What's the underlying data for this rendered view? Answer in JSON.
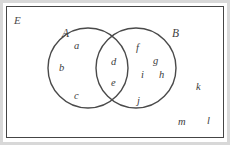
{
  "diagram": {
    "type": "venn",
    "universe_label": "E",
    "sets": [
      {
        "id": "A",
        "label": "A",
        "side": "left"
      },
      {
        "id": "B",
        "label": "B",
        "side": "right"
      }
    ],
    "regions": {
      "A_only": [
        "a",
        "b",
        "c"
      ],
      "intersection": [
        "d",
        "e"
      ],
      "B_only": [
        "f",
        "g",
        "i",
        "h",
        "j"
      ],
      "outside": [
        "k",
        "m",
        "l"
      ]
    },
    "elements": [
      {
        "text": "a",
        "region": "A_only",
        "x": 74,
        "y": 41
      },
      {
        "text": "b",
        "region": "A_only",
        "x": 59,
        "y": 63
      },
      {
        "text": "c",
        "region": "A_only",
        "x": 74,
        "y": 91
      },
      {
        "text": "d",
        "region": "intersection",
        "x": 111,
        "y": 57
      },
      {
        "text": "e",
        "region": "intersection",
        "x": 111,
        "y": 78
      },
      {
        "text": "f",
        "region": "B_only",
        "x": 136,
        "y": 43
      },
      {
        "text": "g",
        "region": "B_only",
        "x": 153,
        "y": 56
      },
      {
        "text": "i",
        "region": "B_only",
        "x": 141,
        "y": 70
      },
      {
        "text": "h",
        "region": "B_only",
        "x": 159,
        "y": 70
      },
      {
        "text": "j",
        "region": "B_only",
        "x": 137,
        "y": 96
      },
      {
        "text": "k",
        "region": "outside",
        "x": 196,
        "y": 82
      },
      {
        "text": "m",
        "region": "outside",
        "x": 178,
        "y": 117
      },
      {
        "text": "l",
        "region": "outside",
        "x": 207,
        "y": 116
      }
    ],
    "set_labels": [
      {
        "text": "A",
        "x": 62,
        "y": 28
      },
      {
        "text": "B",
        "x": 172,
        "y": 28
      }
    ],
    "universe_label_pos": {
      "x": 14,
      "y": 15
    },
    "colors": {
      "stroke": "#454545",
      "circle_stroke": "#4a4a4a",
      "text": "#3c3c3c",
      "background": "#ffffff",
      "outer_frame": "#d8d8d8"
    },
    "geometry": {
      "rect": {
        "x": 6,
        "y": 6,
        "width": 218,
        "height": 132
      },
      "circle_A": {
        "cx": 88,
        "cy": 68,
        "r": 40
      },
      "circle_B": {
        "cx": 136,
        "cy": 68,
        "r": 40
      }
    }
  }
}
